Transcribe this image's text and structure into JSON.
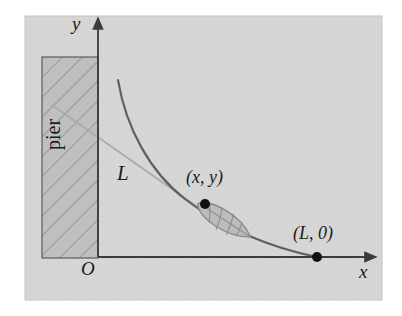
{
  "figure": {
    "type": "math-diagram",
    "panel": {
      "background_color": "#d6d6d6",
      "border_color": "#c2c2c2",
      "x": 25,
      "y": 16,
      "width": 357,
      "height": 284
    },
    "axes": {
      "origin_label": "O",
      "x_axis_label": "x",
      "y_axis_label": "y",
      "origin_px": {
        "x": 98,
        "y": 257
      },
      "x_axis_end_px": {
        "x": 372,
        "y": 257
      },
      "y_axis_end_px": {
        "x": 98,
        "y": 22
      },
      "axis_color": "#3b3b3b"
    },
    "pier": {
      "label": "pier",
      "fill_color": "#bdbdbd",
      "hatch_color": "#8f8f8f",
      "border_color": "#5a5a5a",
      "rect_px": {
        "x": 42,
        "y": 57,
        "width": 56,
        "height": 201
      }
    },
    "curve": {
      "name": "tractrix",
      "color": "#5c5c5c",
      "start_px": {
        "x": 118,
        "y": 80
      },
      "end_px": {
        "x": 317,
        "y": 257
      }
    },
    "rope": {
      "label": "L",
      "color": "#a6a6a6",
      "start_px": {
        "x": 56,
        "y": 110
      },
      "end_px": {
        "x": 229,
        "y": 229
      }
    },
    "points": [
      {
        "name": "boat-point",
        "label": "(x, y)",
        "px": {
          "x": 205,
          "y": 204
        }
      },
      {
        "name": "end-point",
        "label": "(L, 0)",
        "px": {
          "x": 317,
          "y": 257
        }
      }
    ],
    "boat": {
      "name": "boat",
      "fill_color": "#b9b9b9",
      "outline_color": "#8a8a8a",
      "center_px": {
        "x": 224,
        "y": 222
      },
      "rotation_deg": 35
    }
  }
}
